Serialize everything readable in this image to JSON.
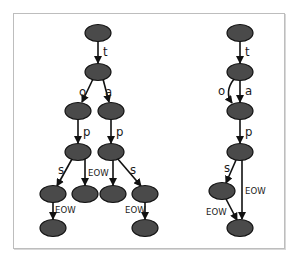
{
  "diagram": {
    "title": "",
    "colors": {
      "node_fill": "#4a4a4a",
      "node_stroke": "#111111",
      "edge": "#111111",
      "frame": "#bdbdbd"
    },
    "left_tree": {
      "name": "trie",
      "nodes": [
        {
          "id": "L0",
          "x": 98,
          "y": 33
        },
        {
          "id": "L1",
          "x": 98,
          "y": 72
        },
        {
          "id": "L2",
          "x": 78,
          "y": 111
        },
        {
          "id": "L3",
          "x": 111,
          "y": 111
        },
        {
          "id": "L4",
          "x": 78,
          "y": 152
        },
        {
          "id": "L5",
          "x": 111,
          "y": 152
        },
        {
          "id": "L6",
          "x": 53,
          "y": 194
        },
        {
          "id": "L7",
          "x": 85,
          "y": 194
        },
        {
          "id": "L8",
          "x": 113,
          "y": 194
        },
        {
          "id": "L9",
          "x": 145,
          "y": 194
        },
        {
          "id": "L10",
          "x": 53,
          "y": 228
        },
        {
          "id": "L11",
          "x": 145,
          "y": 228
        }
      ],
      "edges": [
        {
          "from": "L0",
          "to": "L1",
          "label": "t"
        },
        {
          "from": "L1",
          "to": "L2",
          "label": "o"
        },
        {
          "from": "L1",
          "to": "L3",
          "label": "a"
        },
        {
          "from": "L2",
          "to": "L4",
          "label": "p"
        },
        {
          "from": "L3",
          "to": "L5",
          "label": "p"
        },
        {
          "from": "L4",
          "to": "L6",
          "label": "s"
        },
        {
          "from": "L4",
          "to": "L7",
          "label": "EOW"
        },
        {
          "from": "L5",
          "to": "L8",
          "label": "EOW"
        },
        {
          "from": "L5",
          "to": "L9",
          "label": "s"
        },
        {
          "from": "L6",
          "to": "L10",
          "label": "EOW"
        },
        {
          "from": "L9",
          "to": "L11",
          "label": "EOW"
        }
      ]
    },
    "right_tree": {
      "name": "dawg",
      "nodes": [
        {
          "id": "R0",
          "x": 240,
          "y": 33
        },
        {
          "id": "R1",
          "x": 240,
          "y": 72
        },
        {
          "id": "R2",
          "x": 240,
          "y": 111
        },
        {
          "id": "R3",
          "x": 240,
          "y": 152
        },
        {
          "id": "R4",
          "x": 222,
          "y": 191
        },
        {
          "id": "R5",
          "x": 240,
          "y": 228
        }
      ],
      "edges": [
        {
          "from": "R0",
          "to": "R1",
          "label": "t"
        },
        {
          "from": "R1",
          "to": "R2",
          "label": "o",
          "curved": true
        },
        {
          "from": "R1",
          "to": "R2",
          "label": "a"
        },
        {
          "from": "R2",
          "to": "R3",
          "label": "p"
        },
        {
          "from": "R3",
          "to": "R4",
          "label": "s"
        },
        {
          "from": "R3",
          "to": "R5",
          "label": "EOW"
        },
        {
          "from": "R4",
          "to": "R5",
          "label": "EOW"
        }
      ]
    },
    "labels": {
      "t": "t",
      "o": "o",
      "a": "a",
      "p": "p",
      "s": "s",
      "eow": "EOW"
    }
  }
}
